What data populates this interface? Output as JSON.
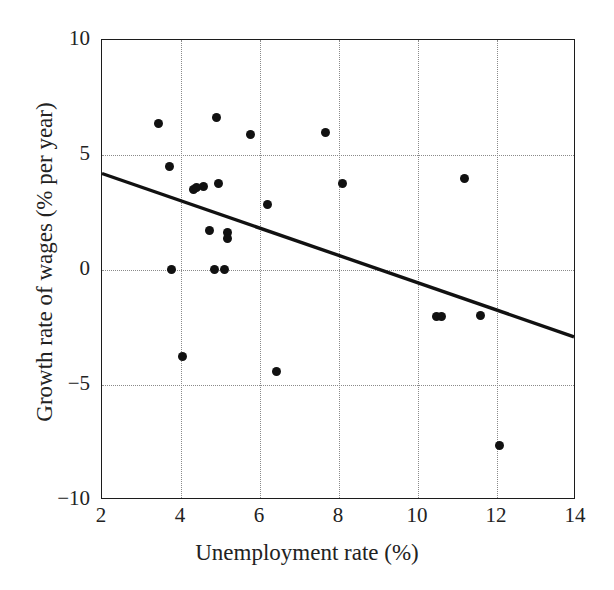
{
  "chart_data": {
    "type": "scatter",
    "title": "",
    "xlabel": "Unemployment rate (%)",
    "ylabel": "Growth rate of wages (% per year)",
    "xlim": [
      2,
      14
    ],
    "ylim": [
      -10,
      10
    ],
    "xticks": [
      2,
      4,
      6,
      8,
      10,
      12,
      14
    ],
    "xtick_labels": [
      "2",
      "4",
      "6",
      "8",
      "10",
      "12",
      "14"
    ],
    "yticks": [
      -10,
      -5,
      0,
      5,
      10
    ],
    "ytick_labels": [
      "−10",
      "−5",
      "0",
      "5",
      "10"
    ],
    "grid": true,
    "grid_style": "dotted",
    "grid_color": "#8a8a8a",
    "legend": false,
    "marker_color": "#111111",
    "marker_shape": "circle",
    "series": [
      {
        "name": "Observations",
        "points": [
          {
            "x": 3.42,
            "y": 6.39
          },
          {
            "x": 3.7,
            "y": 4.52
          },
          {
            "x": 3.75,
            "y": 0.04
          },
          {
            "x": 4.03,
            "y": -3.74
          },
          {
            "x": 4.31,
            "y": 3.48
          },
          {
            "x": 4.38,
            "y": 3.57
          },
          {
            "x": 4.58,
            "y": 3.61
          },
          {
            "x": 4.71,
            "y": 1.7
          },
          {
            "x": 4.84,
            "y": 0.04
          },
          {
            "x": 4.91,
            "y": 6.65
          },
          {
            "x": 4.96,
            "y": 3.78
          },
          {
            "x": 5.09,
            "y": 0.04
          },
          {
            "x": 5.18,
            "y": 1.61
          },
          {
            "x": 5.18,
            "y": 1.39
          },
          {
            "x": 5.77,
            "y": 5.87
          },
          {
            "x": 6.2,
            "y": 2.83
          },
          {
            "x": 6.41,
            "y": -4.43
          },
          {
            "x": 7.67,
            "y": 5.96
          },
          {
            "x": 8.08,
            "y": 3.78
          },
          {
            "x": 10.48,
            "y": -2.0
          },
          {
            "x": 10.6,
            "y": -2.0
          },
          {
            "x": 11.17,
            "y": 3.96
          },
          {
            "x": 11.59,
            "y": -1.96
          },
          {
            "x": 12.07,
            "y": -7.65
          }
        ]
      }
    ],
    "trendline": {
      "name": "fitted regression line",
      "x_start": 2,
      "y_start": 4.17,
      "x_end": 14,
      "y_end": -2.96,
      "slope": -0.594,
      "intercept": 5.36,
      "color": "#111111",
      "width_px": 3.4
    }
  }
}
